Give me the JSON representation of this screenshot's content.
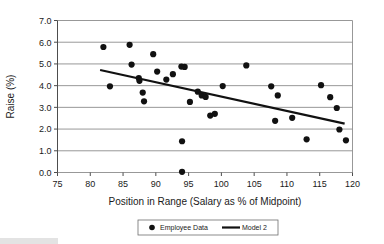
{
  "chart_data": {
    "type": "scatter",
    "title": "",
    "xlabel": "Position in Range (Salary as % of Midpoint)",
    "ylabel": "Raise (%)",
    "xlim": [
      75,
      120
    ],
    "ylim": [
      0.0,
      7.0
    ],
    "xticks": [
      "75",
      "80",
      "85",
      "90",
      "95",
      "100",
      "105",
      "110",
      "115",
      "120"
    ],
    "xtick_values": [
      75,
      80,
      85,
      90,
      95,
      100,
      105,
      110,
      115,
      120
    ],
    "yticks": [
      "0.0",
      "1.0",
      "2.0",
      "3.0",
      "4.0",
      "5.0",
      "6.0",
      "7.0"
    ],
    "ytick_values": [
      0.0,
      1.0,
      2.0,
      3.0,
      4.0,
      5.0,
      6.0,
      7.0
    ],
    "grid": true,
    "grid_axis": "y",
    "legend_position": "bottom",
    "series": [
      {
        "name": "Employee Data",
        "type": "scatter",
        "marker": "circle",
        "color": "#111111",
        "points": [
          [
            82.0,
            5.78
          ],
          [
            83.0,
            3.97
          ],
          [
            86.0,
            5.88
          ],
          [
            86.3,
            4.97
          ],
          [
            87.4,
            4.35
          ],
          [
            87.5,
            4.22
          ],
          [
            88.0,
            3.68
          ],
          [
            88.2,
            3.28
          ],
          [
            89.6,
            5.45
          ],
          [
            90.2,
            4.65
          ],
          [
            91.6,
            4.28
          ],
          [
            93.9,
            4.88
          ],
          [
            94.4,
            4.86
          ],
          [
            94.0,
            1.44
          ],
          [
            94.0,
            0.03
          ],
          [
            92.6,
            4.53
          ],
          [
            95.2,
            3.25
          ],
          [
            96.4,
            3.72
          ],
          [
            97.0,
            3.55
          ],
          [
            97.6,
            3.48
          ],
          [
            98.3,
            2.62
          ],
          [
            99.0,
            2.7
          ],
          [
            100.2,
            3.98
          ],
          [
            103.8,
            4.93
          ],
          [
            107.6,
            3.97
          ],
          [
            108.2,
            2.38
          ],
          [
            108.6,
            3.55
          ],
          [
            110.8,
            2.52
          ],
          [
            113.0,
            1.53
          ],
          [
            115.2,
            4.02
          ],
          [
            116.6,
            3.47
          ],
          [
            117.6,
            2.97
          ],
          [
            118.0,
            1.98
          ],
          [
            119.0,
            1.48
          ]
        ]
      },
      {
        "name": "Model 2",
        "type": "line",
        "color": "#111111",
        "endpoints": [
          [
            81.5,
            4.72
          ],
          [
            118.8,
            2.25
          ]
        ]
      }
    ],
    "legend": [
      {
        "label": "Employee Data",
        "marker": "circle",
        "color": "#111111"
      },
      {
        "label": "Model 2",
        "marker": "line",
        "color": "#111111"
      }
    ]
  }
}
